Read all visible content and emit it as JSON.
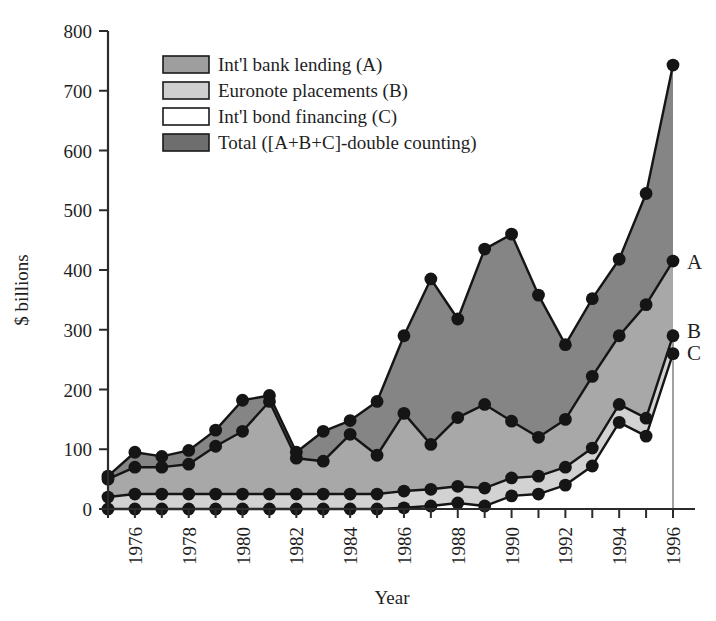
{
  "chart_data": {
    "type": "area",
    "title": "",
    "xlabel": "Year",
    "ylabel": "$ billions",
    "xlim": [
      1975,
      1996
    ],
    "ylim": [
      0,
      800
    ],
    "ytick_values": [
      0,
      100,
      200,
      300,
      400,
      500,
      600,
      700,
      800
    ],
    "ytick_labels": [
      "0",
      "100",
      "200",
      "300",
      "400",
      "500",
      "600",
      "700",
      "800"
    ],
    "xtick_values": [
      1976,
      1978,
      1980,
      1982,
      1984,
      1986,
      1988,
      1990,
      1992,
      1994,
      1996
    ],
    "xtick_labels": [
      "1976",
      "1978",
      "1980",
      "1982",
      "1984",
      "1986",
      "1988",
      "1990",
      "1992",
      "1994",
      "1996"
    ],
    "minor_xticks_every": 1,
    "grid": false,
    "legend_position": "upper-left-inside",
    "stacked": true,
    "x": [
      1975,
      1976,
      1977,
      1978,
      1979,
      1980,
      1981,
      1982,
      1983,
      1984,
      1985,
      1986,
      1987,
      1988,
      1989,
      1990,
      1991,
      1992,
      1993,
      1994,
      1995,
      1996
    ],
    "series": [
      {
        "name": "Int'l bond financing (C)",
        "key": "C",
        "tag": "C",
        "color": "#ffffff",
        "values": [
          0,
          0,
          0,
          0,
          0,
          0,
          0,
          0,
          0,
          0,
          0,
          2,
          5,
          10,
          5,
          22,
          25,
          40,
          72,
          145,
          122,
          260
        ]
      },
      {
        "name": "Euronote placements (B)",
        "key": "B",
        "tag": "B",
        "color": "#cfcfcf",
        "values": [
          20,
          25,
          25,
          25,
          25,
          25,
          25,
          25,
          25,
          25,
          25,
          28,
          28,
          28,
          30,
          30,
          30,
          30,
          30,
          30,
          30,
          30
        ]
      },
      {
        "name": "Int'l bank lending (A)",
        "key": "A",
        "tag": "A",
        "color": "#9e9e9e",
        "values": [
          30,
          45,
          45,
          50,
          80,
          105,
          155,
          60,
          55,
          100,
          65,
          130,
          75,
          115,
          140,
          95,
          65,
          80,
          120,
          115,
          190,
          125
        ]
      },
      {
        "name": "Total ([A+B+C]-double counting)",
        "key": "total",
        "tag": "",
        "color": "#808080",
        "values": [
          55,
          95,
          88,
          98,
          132,
          182,
          190,
          95,
          130,
          148,
          180,
          290,
          385,
          318,
          435,
          460,
          358,
          275,
          352,
          418,
          528,
          743
        ]
      }
    ],
    "derived_lines": {
      "line_C": [
        0,
        0,
        0,
        0,
        0,
        0,
        0,
        0,
        0,
        0,
        0,
        2,
        5,
        10,
        5,
        22,
        25,
        40,
        72,
        145,
        122,
        260
      ],
      "line_BC": [
        20,
        25,
        25,
        25,
        25,
        25,
        25,
        25,
        25,
        25,
        25,
        30,
        33,
        38,
        35,
        52,
        55,
        70,
        102,
        175,
        152,
        290
      ],
      "line_ABC": [
        50,
        70,
        70,
        75,
        105,
        130,
        180,
        85,
        80,
        125,
        90,
        160,
        108,
        153,
        175,
        147,
        120,
        150,
        222,
        290,
        342,
        415
      ],
      "line_total": [
        55,
        95,
        88,
        98,
        132,
        182,
        190,
        95,
        130,
        148,
        180,
        290,
        385,
        318,
        435,
        460,
        358,
        275,
        352,
        418,
        528,
        743
      ]
    },
    "annotations": [
      {
        "text": "A",
        "year": 1996,
        "value": 415
      },
      {
        "text": "B",
        "year": 1996,
        "value": 300
      },
      {
        "text": "C",
        "year": 1996,
        "value": 262
      }
    ]
  },
  "legend": {
    "items": [
      {
        "label": "Int'l bank lending (A)",
        "swatch": "#9e9e9e"
      },
      {
        "label": "Euronote placements (B)",
        "swatch": "#cfcfcf"
      },
      {
        "label": "Int'l bond financing (C)",
        "swatch": "#ffffff"
      },
      {
        "label": "Total ([A+B+C]-double counting)",
        "swatch": "#6e6e6e"
      }
    ]
  },
  "axes": {
    "y_title": "$ billions",
    "x_title": "Year"
  },
  "colors": {
    "band_total": "#858585",
    "band_A": "#a8a8a8",
    "band_B": "#d2d2d2",
    "band_C": "#ffffff",
    "line": "#151515",
    "text": "#1f1f1f"
  }
}
